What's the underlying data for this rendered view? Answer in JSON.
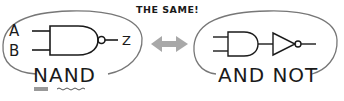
{
  "diagram": {
    "title": "THE SAME!",
    "left": {
      "label": "NAND",
      "gate": "nand-gate",
      "inputs": [
        "A",
        "B"
      ],
      "output": "Z"
    },
    "right": {
      "label": "AND NOT",
      "gates": [
        "and-gate",
        "not-gate"
      ]
    },
    "connector": "double-arrow",
    "colors": {
      "ink": "#1a1a1a",
      "outline": "#777777",
      "arrow": "#a8a8a8",
      "highlight": "#999999"
    }
  }
}
